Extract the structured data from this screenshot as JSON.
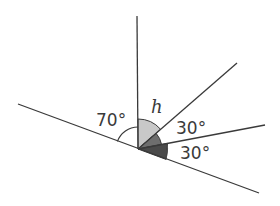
{
  "diagram": {
    "vertex": {
      "x": 138,
      "y": 149
    },
    "lines": [
      {
        "name": "vertical-ray",
        "x1": 138,
        "y1": 149,
        "x2": 137,
        "y2": 16
      },
      {
        "name": "upper-right-ray",
        "x1": 138,
        "y1": 149,
        "x2": 237,
        "y2": 63
      },
      {
        "name": "middle-right-ray",
        "x1": 138,
        "y1": 149,
        "x2": 265,
        "y2": 125
      },
      {
        "name": "straight-line",
        "x1": 18,
        "y1": 104,
        "x2": 259,
        "y2": 193
      }
    ],
    "labels": {
      "angle_left": "70°",
      "angle_h": "h",
      "angle_upper_30": "30°",
      "angle_lower_30": "30°"
    },
    "colors": {
      "line": "#3a3a3a",
      "sector_h": "#c8c8c8",
      "sector_upper_30": "#6e6e6e",
      "sector_lower_30": "#4a4a4a",
      "arc_70": "#3a3a3a"
    },
    "angles_deg": {
      "left_angle": 70,
      "h": "unknown",
      "upper_30": 30,
      "lower_30": 30
    }
  }
}
